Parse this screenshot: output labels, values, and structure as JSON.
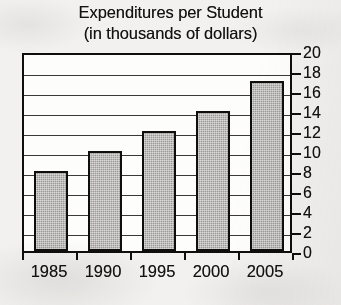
{
  "chart_data": {
    "type": "bar",
    "title": "Expenditures per Student",
    "subtitle": "(in thousands of dollars)",
    "title_lines": [
      "Expenditures per Student",
      "(in thousands of dollars)"
    ],
    "categories": [
      "1985",
      "1990",
      "1995",
      "2000",
      "2005"
    ],
    "values": [
      8,
      10,
      12,
      14,
      17
    ],
    "xlabel": "",
    "ylabel": "",
    "ylim": [
      0,
      20
    ],
    "ytick_step": 2,
    "yticks": [
      "20",
      "18",
      "16",
      "14",
      "12",
      "10",
      "8",
      "6",
      "4",
      "2",
      "0"
    ],
    "ytick_values": [
      20,
      18,
      16,
      14,
      12,
      10,
      8,
      6,
      4,
      2,
      0
    ],
    "grid": true,
    "grid_axis": "y",
    "legend": false,
    "axis_position": "right",
    "colors": {
      "bar_fill": "#9b9a98",
      "bar_outline": "#100e0c",
      "gridline": "#2a2724",
      "axis": "#100e0c",
      "text": "#14120f",
      "plot_background": "#fdfdfc",
      "page_background": "#f2f1ef"
    }
  }
}
